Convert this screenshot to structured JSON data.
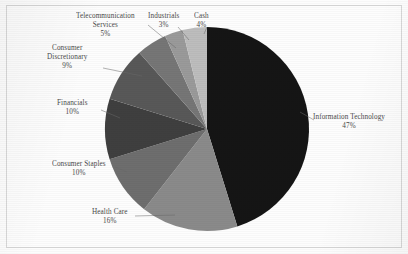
{
  "chart_data": {
    "type": "pie",
    "title": "",
    "xlabel": "",
    "ylabel": "",
    "legend_position": "none",
    "grid": false,
    "label_format": "name above percent",
    "start_angle_deg": 0,
    "direction": "clockwise",
    "categories": [
      "Information Technology",
      "Health Care",
      "Consumer Staples",
      "Financials",
      "Consumer Discretionary",
      "Telecommunication Services",
      "Industrials",
      "Cash"
    ],
    "values": [
      47,
      16,
      10,
      10,
      9,
      5,
      3,
      4
    ],
    "value_labels": [
      "47%",
      "16%",
      "10%",
      "10%",
      "9%",
      "5%",
      "3%",
      "4%"
    ],
    "colors": [
      "#151515",
      "#8a8a8a",
      "#6e6e6e",
      "#3f3f3f",
      "#585858",
      "#767676",
      "#9a9a9a",
      "#bdbdbd"
    ],
    "slices": [
      {
        "name": "Information Technology",
        "value": 47,
        "label": "Information Technology",
        "pct": "47%",
        "color": "#151515"
      },
      {
        "name": "Health Care",
        "value": 16,
        "label": "Health Care",
        "pct": "16%",
        "color": "#8a8a8a"
      },
      {
        "name": "Consumer Staples",
        "value": 10,
        "label": "Consumer Staples",
        "pct": "10%",
        "color": "#6e6e6e"
      },
      {
        "name": "Financials",
        "value": 10,
        "label": "Financials",
        "pct": "10%",
        "color": "#3f3f3f"
      },
      {
        "name": "Consumer Discretionary",
        "value": 9,
        "label": "Consumer Discretionary",
        "pct": "9%",
        "color": "#585858"
      },
      {
        "name": "Telecommunication Services",
        "value": 5,
        "label": "Telecommunication Services",
        "pct": "5%",
        "color": "#767676"
      },
      {
        "name": "Industrials",
        "value": 3,
        "label": "Industrials",
        "pct": "3%",
        "color": "#9a9a9a"
      },
      {
        "name": "Cash",
        "value": 4,
        "label": "Cash",
        "pct": "4%",
        "color": "#bdbdbd"
      }
    ]
  },
  "labels": {
    "information_technology": {
      "line1": "Information Technology",
      "pct": "47%"
    },
    "health_care": {
      "line1": "Health Care",
      "pct": "16%"
    },
    "consumer_staples": {
      "line1": "Consumer Staples",
      "pct": "10%"
    },
    "financials": {
      "line1": "Financials",
      "pct": "10%"
    },
    "consumer_discretionary": {
      "line1": "Consumer",
      "line2": "Discretionary",
      "pct": "9%"
    },
    "telecommunication": {
      "line1": "Telecommunication",
      "line2": "Services",
      "pct": "5%"
    },
    "industrials": {
      "line1": "Industrials",
      "pct": "3%"
    },
    "cash": {
      "line1": "Cash",
      "pct": "4%"
    }
  }
}
